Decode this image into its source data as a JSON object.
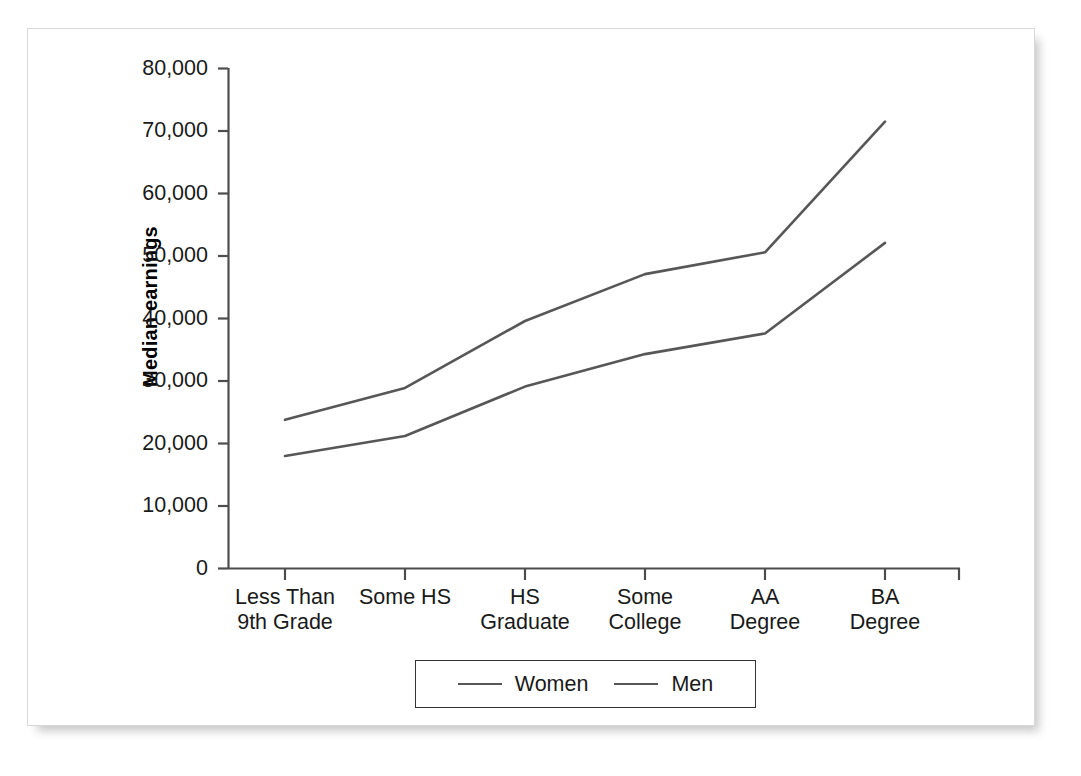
{
  "chart_data": {
    "type": "line",
    "title": "",
    "xlabel": "",
    "ylabel": "Median earnings",
    "categories": [
      "Less Than\n9th Grade",
      "Some HS",
      "HS\nGraduate",
      "Some\nCollege",
      "AA\nDegree",
      "BA\nDegree"
    ],
    "series": [
      {
        "name": "Women",
        "color": "#575757",
        "values": [
          18000,
          21200,
          29100,
          34300,
          37600,
          52100
        ]
      },
      {
        "name": "Men",
        "color": "#575757",
        "values": [
          23800,
          28900,
          39600,
          47100,
          50600,
          71500
        ]
      }
    ],
    "ylim": [
      0,
      80000
    ],
    "ytick_values": [
      0,
      10000,
      20000,
      30000,
      40000,
      50000,
      60000,
      70000,
      80000
    ],
    "ytick_labels": [
      "0",
      "10,000",
      "20,000",
      "30,000",
      "40,000",
      "50,000",
      "60,000",
      "70,000",
      "80,000"
    ],
    "grid": false,
    "legend_position": "bottom-center",
    "legend_entries": [
      "Women",
      "Men"
    ]
  },
  "axes": {
    "y_title": "Median earnings",
    "y_ticks": [
      "80,000",
      "70,000",
      "60,000",
      "50,000",
      "40,000",
      "30,000",
      "20,000",
      "10,000",
      "0"
    ],
    "x_ticks": [
      "Less Than\n9th Grade",
      "Some HS",
      "HS\nGraduate",
      "Some\nCollege",
      "AA\nDegree",
      "BA\nDegree"
    ]
  },
  "legend": {
    "items": [
      {
        "label": "Women",
        "color": "#575757"
      },
      {
        "label": "Men",
        "color": "#575757"
      }
    ]
  },
  "colors": {
    "line": "#575757",
    "axis": "#4d4d4d",
    "text": "#1a1a1a",
    "card_border": "#d8d8d8",
    "background": "#ffffff"
  }
}
